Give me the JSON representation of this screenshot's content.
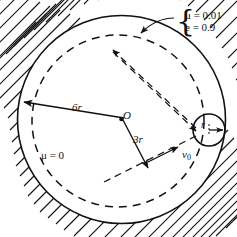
{
  "figure": {
    "labels": {
      "mu_wall": "μ = 0.01",
      "e_wall": "e = 0.9",
      "mu_interior": "μ = 0",
      "radius_outer": "6r",
      "radius_inner": "3r",
      "ball_radius": "r",
      "center": "O",
      "velocity": "v",
      "velocity_sub": "0",
      "brace": "{"
    },
    "values": {
      "friction_wall": "0.01",
      "restitution": "0.9",
      "friction_interior": "0",
      "outer_radius_multiplier": "6",
      "inner_radius_multiplier": "3",
      "ball_radius_multiplier": "1"
    },
    "colors": {
      "ink": "#111111",
      "background": "#ffffff"
    },
    "icons": {
      "arrow_6r": "arrow-left-icon",
      "arrow_3r": "arrow-down-right-icon",
      "arrow_r": "arrow-right-icon",
      "arrow_v0": "arrow-up-right-icon",
      "arrow_leader": "arrow-down-left-icon",
      "arrow_traj_in": "arrow-down-left-icon",
      "arrow_traj_out": "arrow-up-right-icon"
    }
  }
}
